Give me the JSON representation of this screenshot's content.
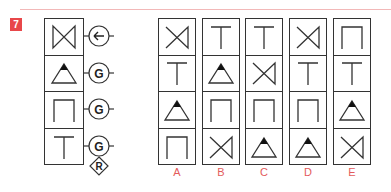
{
  "question_number": "7",
  "sequence": {
    "cells": [
      "x-bowtie",
      "triangle",
      "arch",
      "tee"
    ],
    "operators": [
      "left-arrow",
      "G",
      "G",
      "G"
    ],
    "final_operator": "R"
  },
  "options": [
    {
      "label": "A",
      "cells": [
        "x-bowtie-right",
        "tee",
        "triangle",
        "arch"
      ]
    },
    {
      "label": "B",
      "cells": [
        "tee",
        "triangle",
        "arch",
        "x-bowtie-right"
      ]
    },
    {
      "label": "C",
      "cells": [
        "tee",
        "x-bowtie-right",
        "arch",
        "triangle"
      ]
    },
    {
      "label": "D",
      "cells": [
        "x-bowtie-right",
        "tee",
        "arch",
        "triangle"
      ]
    },
    {
      "label": "E",
      "cells": [
        "arch",
        "tee",
        "triangle",
        "x-bowtie-right"
      ]
    }
  ],
  "colors": {
    "accent": "#e8474a",
    "label": "#e35b5b",
    "stroke": "#333333"
  }
}
